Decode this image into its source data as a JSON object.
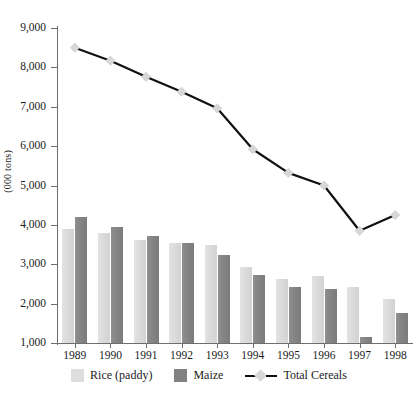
{
  "chart_data": {
    "type": "bar",
    "title": "",
    "subtitle": "",
    "xlabel": "",
    "ylabel": "(000 tons)",
    "categories": [
      "1989",
      "1990",
      "1991",
      "1992",
      "1993",
      "1994",
      "1995",
      "1996",
      "1997",
      "1998"
    ],
    "ylim": [
      1000,
      9000
    ],
    "ytick_values": [
      1000,
      2000,
      3000,
      4000,
      5000,
      6000,
      7000,
      8000,
      9000
    ],
    "ytick_labels": [
      "1,000",
      "2,000",
      "3,000",
      "4,000",
      "5,000",
      "6,000",
      "7,000",
      "8,000",
      "9,000"
    ],
    "grid": false,
    "legend_position": "bottom",
    "series": [
      {
        "name": "Rice (paddy)",
        "type": "bar",
        "color": "#dedede",
        "values": [
          3900,
          3800,
          3620,
          3540,
          3490,
          2930,
          2630,
          2700,
          2420,
          2130
        ]
      },
      {
        "name": "Maize",
        "type": "bar",
        "color": "#828282",
        "values": [
          4200,
          3950,
          3730,
          3540,
          3230,
          2740,
          2420,
          2380,
          1150,
          1770
        ]
      },
      {
        "name": "Total Cereals",
        "type": "line",
        "color": "#111111",
        "marker": "diamond",
        "marker_color": "#d8d8d8",
        "values": [
          8500,
          8170,
          7760,
          7380,
          6960,
          5920,
          5320,
          5000,
          3850,
          4250
        ]
      }
    ]
  },
  "legend": {
    "items": [
      {
        "label": "Rice (paddy)",
        "marker": "square-light"
      },
      {
        "label": "Maize",
        "marker": "square-dark"
      },
      {
        "label": "Total Cereals",
        "marker": "line-diamond"
      }
    ]
  }
}
